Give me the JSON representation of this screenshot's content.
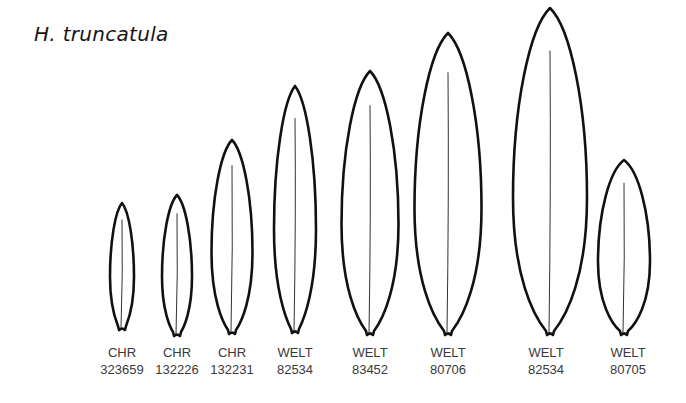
{
  "title": "H. truncatula",
  "colors": {
    "outline": "#111111",
    "text": "#3a3a3a",
    "background": "#ffffff"
  },
  "specimens": [
    {
      "herbarium": "CHR",
      "number": "323659",
      "cx": 122,
      "top": 203,
      "bottom": 330,
      "width": 24
    },
    {
      "herbarium": "CHR",
      "number": "132226",
      "cx": 177,
      "top": 195,
      "bottom": 336,
      "width": 30
    },
    {
      "herbarium": "CHR",
      "number": "132231",
      "cx": 232,
      "top": 140,
      "bottom": 334,
      "width": 41
    },
    {
      "herbarium": "WELT",
      "number": "82534",
      "cx": 295,
      "top": 86,
      "bottom": 333,
      "width": 42
    },
    {
      "herbarium": "WELT",
      "number": "83452",
      "cx": 370,
      "top": 71,
      "bottom": 335,
      "width": 57
    },
    {
      "herbarium": "WELT",
      "number": "80706",
      "cx": 448,
      "top": 33,
      "bottom": 335,
      "width": 67
    },
    {
      "herbarium": "WELT",
      "number": "82534",
      "cx": 550,
      "top": 8,
      "bottom": 335,
      "width": 74
    },
    {
      "herbarium": "WELT",
      "number": "80705",
      "cx": 624,
      "top": 160,
      "bottom": 335,
      "width": 52
    }
  ]
}
